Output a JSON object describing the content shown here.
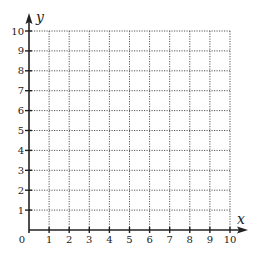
{
  "chart_data": {
    "type": "scatter",
    "title": "",
    "xlabel": "x",
    "ylabel": "y",
    "xlim": [
      0,
      10
    ],
    "ylim": [
      0,
      10
    ],
    "x_ticks": [
      "0",
      "1",
      "2",
      "3",
      "4",
      "5",
      "6",
      "7",
      "8",
      "9",
      "10"
    ],
    "y_ticks": [
      "1",
      "2",
      "3",
      "4",
      "5",
      "6",
      "7",
      "8",
      "9",
      "10"
    ],
    "origin_label": "0",
    "grid": true,
    "grid_style": "dotted",
    "series": [],
    "colors": {
      "axis": "#222222",
      "grid": "#555555",
      "background": "#ffffff"
    }
  },
  "axes": {
    "x_label": "x",
    "y_label": "y",
    "origin_label": "0",
    "x_tick_labels": [
      "1",
      "2",
      "3",
      "4",
      "5",
      "6",
      "7",
      "8",
      "9",
      "10"
    ],
    "y_tick_labels": [
      "1",
      "2",
      "3",
      "4",
      "5",
      "6",
      "7",
      "8",
      "9",
      "10"
    ]
  }
}
